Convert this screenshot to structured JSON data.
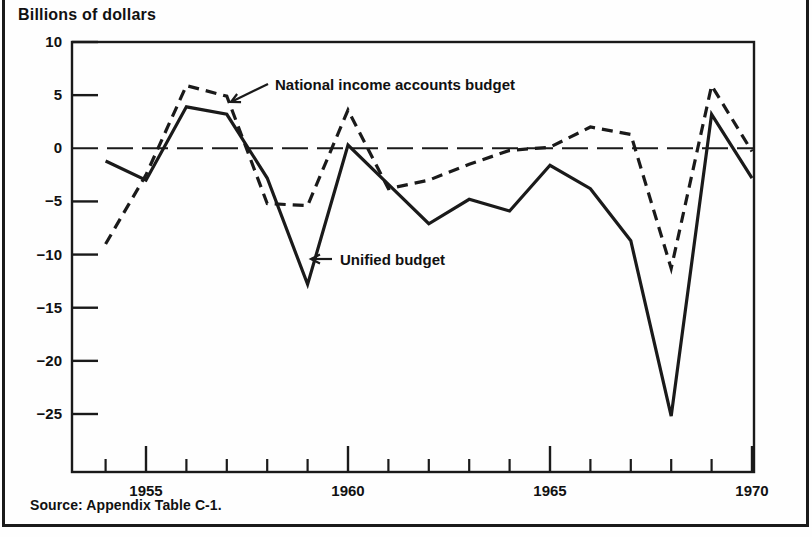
{
  "page": {
    "axis_title": "Billions of dollars",
    "source_note": "Source: Appendix Table C-1."
  },
  "chart_data": {
    "type": "line",
    "title": "",
    "subtitle": "",
    "xlabel": "",
    "ylabel": "Billions of dollars",
    "xlim": [
      1953.4,
      1970.4
    ],
    "ylim": [
      -28.5,
      10
    ],
    "grid": false,
    "zero_line": 0,
    "legend_position": "inline-annotations",
    "ytick_labels": [
      "10",
      "5",
      "0",
      "-5",
      "-10",
      "-15",
      "-20",
      "-25"
    ],
    "yticks": [
      10,
      5,
      0,
      -5,
      -10,
      -15,
      -20,
      -25
    ],
    "xtick_major_labels": [
      "1955",
      "1960",
      "1965",
      "1970"
    ],
    "xticks_major": [
      1955,
      1960,
      1965,
      1970
    ],
    "xticks_minor": [
      1954,
      1956,
      1957,
      1958,
      1959,
      1961,
      1962,
      1963,
      1964,
      1966,
      1967,
      1968,
      1969
    ],
    "x": [
      1954,
      1955,
      1956,
      1957,
      1958,
      1959,
      1960,
      1961,
      1962,
      1963,
      1964,
      1965,
      1966,
      1967,
      1968,
      1969,
      1970
    ],
    "series": [
      {
        "name": "Unified budget",
        "style": "solid",
        "x": [
          1954,
          1955,
          1956,
          1957,
          1958,
          1959,
          1960,
          1961,
          1962,
          1963,
          1964,
          1965,
          1966,
          1967,
          1968,
          1969,
          1970
        ],
        "values": [
          -1.2,
          -3.0,
          3.9,
          3.2,
          -2.8,
          -12.8,
          0.3,
          -3.4,
          -7.1,
          -4.8,
          -5.9,
          -1.6,
          -3.8,
          -8.7,
          -25.2,
          3.2,
          -2.8
        ]
      },
      {
        "name": "National income accounts budget",
        "style": "dashed",
        "x": [
          1954,
          1955,
          1956,
          1957,
          1958,
          1959,
          1960,
          1961,
          1962,
          1963,
          1964,
          1965,
          1966,
          1967,
          1968,
          1969,
          1970
        ],
        "values": [
          -9.0,
          -2.5,
          5.9,
          4.9,
          -5.2,
          -5.4,
          3.6,
          -3.8,
          -3.0,
          -1.5,
          -0.2,
          0.1,
          2.0,
          1.3,
          -11.3,
          5.9,
          -0.3
        ]
      }
    ],
    "annotations": [
      {
        "text": "National income accounts budget",
        "label_x": 275,
        "label_y": 90,
        "arrow_from_x": 268,
        "arrow_from_y": 84,
        "arrow_to_x": 231,
        "arrow_to_y": 102
      },
      {
        "text": "Unified budget",
        "label_x": 340,
        "label_y": 265,
        "arrow_from_x": 332,
        "arrow_from_y": 259,
        "arrow_to_x": 311,
        "arrow_to_y": 259
      }
    ]
  }
}
